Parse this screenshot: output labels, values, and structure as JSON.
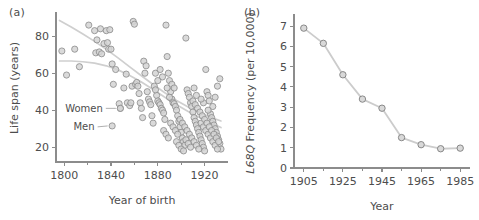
{
  "figure": {
    "background": "#ffffff",
    "marker_fill": "#d4d4d4",
    "marker_stroke": "#8a8a8a",
    "line_color": "#cccccc",
    "axis_color": "#8c8c8c",
    "text_color": "#4d4d4d"
  },
  "panels": {
    "a": {
      "label": "(a)"
    },
    "b": {
      "label": "(b)"
    }
  },
  "chart_data": [
    {
      "panel": "(a)",
      "type": "scatter",
      "title": "",
      "xlabel": "Year of birth",
      "ylabel": "Life span (years)",
      "xlim": [
        1793,
        1940
      ],
      "ylim": [
        12,
        92
      ],
      "xticks": [
        1800,
        1840,
        1880,
        1920
      ],
      "xticklabels": [
        "1800",
        "1840",
        "1880",
        "1920"
      ],
      "xminorticks": [
        1820,
        1860,
        1900
      ],
      "yticks": [
        20,
        40,
        60,
        80
      ],
      "yticklabels": [
        "20",
        "40",
        "60",
        "80"
      ],
      "grid": false,
      "legend": "inline-annotations",
      "annotations": [
        {
          "text": "Women",
          "x": 1833,
          "y": 41,
          "marker_x": 1848,
          "marker_y": 41
        },
        {
          "text": "Men",
          "x": 1826,
          "y": 31,
          "marker_x": 1841,
          "marker_y": 31.5
        }
      ],
      "series": [
        {
          "name": "Women trend",
          "type": "trend-line",
          "points": [
            [
              1796,
              88.5
            ],
            [
              1806,
              85.0
            ],
            [
              1816,
              81.2
            ],
            [
              1826,
              77.2
            ],
            [
              1836,
              72.9
            ],
            [
              1846,
              68.3
            ],
            [
              1856,
              63.4
            ],
            [
              1866,
              58.6
            ],
            [
              1876,
              53.9
            ],
            [
              1886,
              49.4
            ],
            [
              1896,
              45.3
            ],
            [
              1906,
              41.7
            ],
            [
              1916,
              38.6
            ],
            [
              1926,
              36.0
            ],
            [
              1934,
              34.2
            ]
          ]
        },
        {
          "name": "Men trend",
          "type": "trend-line",
          "points": [
            [
              1796,
              66.6
            ],
            [
              1806,
              66.6
            ],
            [
              1816,
              66.2
            ],
            [
              1826,
              65.4
            ],
            [
              1836,
              64.0
            ],
            [
              1846,
              61.8
            ],
            [
              1856,
              58.8
            ],
            [
              1866,
              55.2
            ],
            [
              1876,
              51.2
            ],
            [
              1886,
              47.0
            ],
            [
              1896,
              43.0
            ],
            [
              1906,
              39.3
            ],
            [
              1916,
              35.9
            ],
            [
              1926,
              32.9
            ],
            [
              1934,
              30.6
            ]
          ]
        },
        {
          "name": "Individual life spans",
          "type": "points",
          "points": [
            [
              1798,
              72
            ],
            [
              1802,
              59
            ],
            [
              1809,
              73
            ],
            [
              1813,
              63.5
            ],
            [
              1821,
              86
            ],
            [
              1826,
              83
            ],
            [
              1827,
              71
            ],
            [
              1828,
              78
            ],
            [
              1830,
              71.5
            ],
            [
              1831,
              84
            ],
            [
              1832,
              70.5
            ],
            [
              1834,
              76
            ],
            [
              1836,
              83
            ],
            [
              1837,
              76.5
            ],
            [
              1838,
              73
            ],
            [
              1839,
              83.5
            ],
            [
              1840,
              73
            ],
            [
              1841,
              65
            ],
            [
              1842,
              54
            ],
            [
              1844,
              62
            ],
            [
              1847,
              43.5
            ],
            [
              1848,
              41
            ],
            [
              1851,
              52
            ],
            [
              1853,
              59.5
            ],
            [
              1854,
              44
            ],
            [
              1856,
              42.5
            ],
            [
              1857,
              44
            ],
            [
              1858,
              53
            ],
            [
              1859,
              88
            ],
            [
              1860,
              86.5
            ],
            [
              1861,
              54
            ],
            [
              1862,
              55
            ],
            [
              1863,
              53
            ],
            [
              1864,
              49
            ],
            [
              1865,
              44
            ],
            [
              1866,
              41
            ],
            [
              1867,
              36
            ],
            [
              1868,
              66.5
            ],
            [
              1869,
              60
            ],
            [
              1870,
              64
            ],
            [
              1871,
              50
            ],
            [
              1872,
              46
            ],
            [
              1873,
              44.5
            ],
            [
              1874,
              43
            ],
            [
              1875,
              37
            ],
            [
              1876,
              33
            ],
            [
              1877,
              53
            ],
            [
              1878,
              60
            ],
            [
              1879,
              48
            ],
            [
              1880,
              45
            ],
            [
              1881,
              44
            ],
            [
              1882,
              43
            ],
            [
              1883,
              41
            ],
            [
              1884,
              40
            ],
            [
              1885,
              38.5
            ],
            [
              1886,
              35
            ],
            [
              1887,
              86
            ],
            [
              1888,
              69
            ],
            [
              1889,
              60
            ],
            [
              1890,
              56
            ],
            [
              1891,
              50
            ],
            [
              1892,
              46
            ],
            [
              1893,
              44
            ],
            [
              1894,
              43.5
            ],
            [
              1895,
              42
            ],
            [
              1896,
              40
            ],
            [
              1897,
              37
            ],
            [
              1898,
              34
            ],
            [
              1899,
              31
            ],
            [
              1900,
              28
            ],
            [
              1901,
              25
            ],
            [
              1902,
              23
            ],
            [
              1903,
              21
            ],
            [
              1904,
              79
            ],
            [
              1905,
              51
            ],
            [
              1906,
              49
            ],
            [
              1907,
              47
            ],
            [
              1908,
              44
            ],
            [
              1909,
              42
            ],
            [
              1910,
              39
            ],
            [
              1911,
              36
            ],
            [
              1912,
              34
            ],
            [
              1913,
              32
            ],
            [
              1914,
              30
            ],
            [
              1915,
              28
            ],
            [
              1916,
              26
            ],
            [
              1917,
              24
            ],
            [
              1918,
              22
            ],
            [
              1919,
              20
            ],
            [
              1920,
              18
            ],
            [
              1921,
              62
            ],
            [
              1922,
              50
            ],
            [
              1923,
              48
            ],
            [
              1924,
              45
            ],
            [
              1925,
              38
            ],
            [
              1926,
              36
            ],
            [
              1927,
              34
            ],
            [
              1928,
              32
            ],
            [
              1929,
              30
            ],
            [
              1930,
              28
            ],
            [
              1931,
              26
            ],
            [
              1932,
              24
            ],
            [
              1933,
              22
            ],
            [
              1934,
              19
            ],
            [
              1885,
              29
            ],
            [
              1887,
              27
            ],
            [
              1889,
              25
            ],
            [
              1891,
              33
            ],
            [
              1893,
              31
            ],
            [
              1895,
              29
            ],
            [
              1897,
              27
            ],
            [
              1899,
              35
            ],
            [
              1901,
              33
            ],
            [
              1903,
              31
            ],
            [
              1905,
              29
            ],
            [
              1907,
              27
            ],
            [
              1909,
              25
            ],
            [
              1911,
              23
            ],
            [
              1913,
              21
            ],
            [
              1915,
              19
            ],
            [
              1917,
              33
            ],
            [
              1919,
              31
            ],
            [
              1921,
              29
            ],
            [
              1923,
              27
            ],
            [
              1925,
              25
            ],
            [
              1927,
              23
            ],
            [
              1929,
              21
            ],
            [
              1931,
              19
            ],
            [
              1896,
              23
            ],
            [
              1898,
              21
            ],
            [
              1900,
              19
            ],
            [
              1902,
              18
            ],
            [
              1904,
              24
            ],
            [
              1906,
              22
            ],
            [
              1908,
              20
            ],
            [
              1910,
              45
            ],
            [
              1912,
              43
            ],
            [
              1914,
              41
            ],
            [
              1916,
              39
            ],
            [
              1918,
              37
            ],
            [
              1920,
              35
            ],
            [
              1922,
              33
            ],
            [
              1924,
              31
            ],
            [
              1926,
              29
            ],
            [
              1928,
              27
            ],
            [
              1930,
              25
            ],
            [
              1932,
              23
            ],
            [
              1933,
              57
            ],
            [
              1931,
              53
            ],
            [
              1929,
              47
            ],
            [
              1927,
              42
            ],
            [
              1923,
              40
            ],
            [
              1919,
              44
            ],
            [
              1917,
              46
            ],
            [
              1913,
              48
            ],
            [
              1911,
              52
            ],
            [
              1888,
              52
            ],
            [
              1890,
              47
            ],
            [
              1892,
              54
            ],
            [
              1894,
              52
            ],
            [
              1884,
              58
            ],
            [
              1882,
              62
            ],
            [
              1880,
              56
            ],
            [
              1878,
              51
            ]
          ]
        }
      ]
    },
    {
      "panel": "(b)",
      "type": "line",
      "title": "",
      "xlabel": "Year",
      "ylabel_italic": "L68Q",
      "ylabel_rest": " Frequency (per 10,000)",
      "ylabel": "L68Q Frequency (per 10,000)",
      "xlim": [
        1900,
        1990
      ],
      "ylim": [
        0,
        7.4
      ],
      "xticks": [
        1905,
        1925,
        1945,
        1965,
        1985
      ],
      "xticklabels": [
        "1905",
        "1925",
        "1945",
        "1965",
        "1985"
      ],
      "xminorticks": [
        1915,
        1935,
        1955,
        1975
      ],
      "yticks": [
        0,
        1,
        2,
        3,
        4,
        5,
        6,
        7
      ],
      "yticklabels": [
        "0",
        "1",
        "2",
        "3",
        "4",
        "5",
        "6",
        "7"
      ],
      "grid": false,
      "legend": "none",
      "x": [
        1905,
        1915,
        1925,
        1935,
        1945,
        1955,
        1965,
        1975,
        1985
      ],
      "values": [
        6.9,
        6.15,
        4.6,
        3.4,
        2.95,
        1.5,
        1.15,
        0.95,
        0.98
      ]
    }
  ]
}
